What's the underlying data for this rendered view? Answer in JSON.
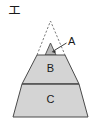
{
  "figure": {
    "label": "エ",
    "type": "pyramid-cross-section-diagram",
    "stroke_color": "#4a4a4a",
    "fill_color": "#d4d4d4",
    "dashed_stroke_color": "#6b6b6b",
    "background": "#ffffff"
  },
  "regions": [
    {
      "id": "apex",
      "label": "A",
      "style": "dashed-outline-with-small-filled-triangle",
      "filled": true,
      "callout": true
    },
    {
      "id": "middle",
      "label": "B",
      "style": "solid-filled-trapezoid",
      "filled": true,
      "callout": false
    },
    {
      "id": "base",
      "label": "C",
      "style": "solid-filled-trapezoid",
      "filled": true,
      "callout": false
    }
  ],
  "callout": {
    "label": "A",
    "leader_line": "from label down-left to small filled apex triangle"
  },
  "geometry": {
    "apex_point": [
      50.5,
      21
    ],
    "dashed_left_base": [
      37,
      55
    ],
    "dashed_right_base": [
      65,
      55
    ],
    "small_triangle_apex": [
      50.5,
      43
    ],
    "small_triangle_left": [
      45,
      55
    ],
    "small_triangle_right": [
      56,
      55
    ],
    "trapezoid_top_left": [
      37,
      55
    ],
    "trapezoid_top_right": [
      65,
      55
    ],
    "trapezoid_bottom_left": [
      13,
      117
    ],
    "trapezoid_bottom_right": [
      88,
      117
    ],
    "divider_y": 84,
    "divider_left": [
      22,
      84
    ],
    "divider_right": [
      79,
      84
    ],
    "label_b_pos": [
      50.5,
      69
    ],
    "label_c_pos": [
      50.5,
      100
    ],
    "label_a_pos": [
      68,
      42
    ],
    "leader_start": [
      67,
      43
    ],
    "leader_end": [
      53,
      51
    ]
  }
}
